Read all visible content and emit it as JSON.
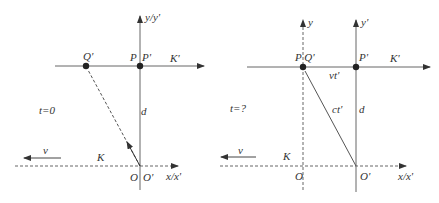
{
  "colors": {
    "line": "#555555",
    "text": "#333333",
    "dot": "#222222",
    "background": "#ffffff"
  },
  "left_panel": {
    "axis_y_label": "y/y'",
    "axis_x_label": "x/x'",
    "frame_moving_label": "K'",
    "frame_rest_label": "K",
    "point_p_label": "P",
    "point_p_prime_label": "P'",
    "point_q_prime_label": "Q'",
    "origin_label": "O",
    "origin_prime_label": "O'",
    "distance_label": "d",
    "time_label": "t=0",
    "velocity_label": "v"
  },
  "right_panel": {
    "axis_y_label": "y",
    "axis_y_prime_label": "y'",
    "axis_x_label": "x/x'",
    "frame_moving_label": "K'",
    "frame_rest_label": "K",
    "point_pq_label": "P Q'",
    "point_p_prime_label": "P'",
    "origin_label": "O",
    "origin_prime_label": "O'",
    "distance_label": "d",
    "displacement_label": "vt'",
    "light_path_label": "ct'",
    "time_label": "t=?",
    "velocity_label": "v"
  }
}
